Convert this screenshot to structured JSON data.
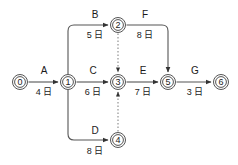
{
  "diagram": {
    "type": "activity-on-arrow-network",
    "title": "",
    "canvas": {
      "width": 238,
      "height": 165,
      "background": "#ffffff"
    },
    "colors": {
      "line": "#555555",
      "dummy_line": "#888888",
      "node_fill": "#ffffff",
      "text": "#1a1a1a"
    },
    "nodes": [
      {
        "id": "n0",
        "label": "0",
        "x": 20,
        "y": 82,
        "r": 7.5
      },
      {
        "id": "n1",
        "label": "1",
        "x": 68,
        "y": 82,
        "r": 7.5
      },
      {
        "id": "n2",
        "label": "2",
        "x": 118,
        "y": 25,
        "r": 7.5
      },
      {
        "id": "n3",
        "label": "3",
        "x": 118,
        "y": 82,
        "r": 7.5
      },
      {
        "id": "n4",
        "label": "4",
        "x": 118,
        "y": 140,
        "r": 7.5
      },
      {
        "id": "n5",
        "label": "5",
        "x": 168,
        "y": 82,
        "r": 7.5
      },
      {
        "id": "n6",
        "label": "6",
        "x": 221,
        "y": 82,
        "r": 7.5
      }
    ],
    "activities": [
      {
        "id": "A",
        "name": "A",
        "duration": "4 日",
        "from": "0",
        "to": "1",
        "name_x": 44,
        "name_y": 74,
        "dur_x": 44,
        "dur_y": 95
      },
      {
        "id": "B",
        "name": "B",
        "duration": "5 日",
        "from": "1",
        "to": "2",
        "name_x": 95,
        "name_y": 18,
        "dur_x": 95,
        "dur_y": 38
      },
      {
        "id": "C",
        "name": "C",
        "duration": "6 日",
        "from": "1",
        "to": "3",
        "name_x": 93,
        "name_y": 74,
        "dur_x": 93,
        "dur_y": 95
      },
      {
        "id": "D",
        "name": "D",
        "duration": "8 日",
        "from": "1",
        "to": "4",
        "name_x": 95,
        "name_y": 134,
        "dur_x": 95,
        "dur_y": 154
      },
      {
        "id": "E",
        "name": "E",
        "duration": "7 日",
        "from": "3",
        "to": "5",
        "name_x": 143,
        "name_y": 74,
        "dur_x": 143,
        "dur_y": 95
      },
      {
        "id": "F",
        "name": "F",
        "duration": "8 日",
        "from": "2",
        "to": "5",
        "name_x": 145,
        "name_y": 18,
        "dur_x": 145,
        "dur_y": 38
      },
      {
        "id": "G",
        "name": "G",
        "duration": "3 日",
        "from": "5",
        "to": "6",
        "name_x": 195,
        "name_y": 74,
        "dur_x": 195,
        "dur_y": 95
      }
    ],
    "dummy_activities": [
      {
        "id": "dummy-2-3",
        "from": "2",
        "to": "3",
        "style": "dotted",
        "direction": "down"
      },
      {
        "id": "dummy-4-3",
        "from": "4",
        "to": "3",
        "style": "dotted",
        "direction": "up"
      }
    ]
  }
}
